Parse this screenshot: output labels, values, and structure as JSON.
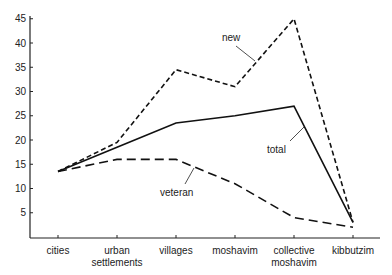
{
  "chart_data": {
    "type": "line",
    "title": "",
    "xlabel": "",
    "ylabel": "",
    "categories": [
      "cities",
      "urban settlements",
      "villages",
      "moshavim",
      "collective moshavim",
      "kibbutzim"
    ],
    "category_lines": [
      [
        "cities"
      ],
      [
        "urban",
        "settlements"
      ],
      [
        "villages"
      ],
      [
        "moshavim"
      ],
      [
        "collective",
        "moshavim"
      ],
      [
        "kibbutzim"
      ]
    ],
    "yticks": [
      5,
      10,
      15,
      20,
      25,
      30,
      35,
      40,
      45
    ],
    "ylim": [
      0,
      46
    ],
    "grid": false,
    "legend": "inline annotations",
    "series": [
      {
        "name": "new",
        "style": "short-dash",
        "values": [
          13.5,
          19.5,
          34.5,
          31,
          45,
          3
        ]
      },
      {
        "name": "total",
        "style": "solid",
        "values": [
          13.5,
          18.5,
          23.5,
          25,
          27,
          3
        ]
      },
      {
        "name": "veteran",
        "style": "long-dash",
        "values": [
          13.5,
          16,
          16,
          11,
          4,
          2
        ]
      }
    ],
    "annotations": [
      {
        "text": "new",
        "series": "new"
      },
      {
        "text": "total",
        "series": "total"
      },
      {
        "text": "veteran",
        "series": "veteran"
      }
    ]
  },
  "colors": {
    "line": "#111111",
    "axis": "#222222"
  }
}
